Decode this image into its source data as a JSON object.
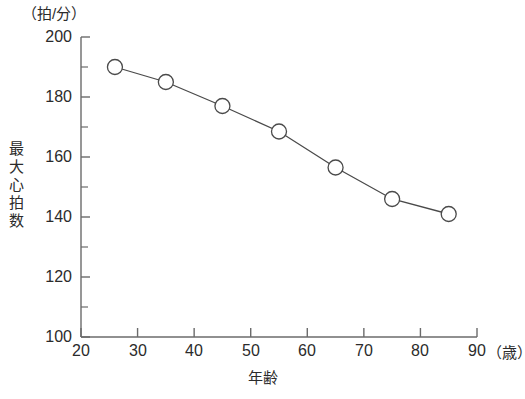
{
  "chart_data": {
    "type": "line",
    "title": "",
    "subtitle": "",
    "xlabel": "年齢",
    "ylabel": "最大心拍数",
    "x_unit": "（歳）",
    "y_unit": "（拍/分）",
    "xlim": [
      20,
      90
    ],
    "ylim": [
      100,
      200
    ],
    "grid": false,
    "legend": "none",
    "x_major_step": 10,
    "y_major_step": 20,
    "y_minor_step": 10,
    "marker": "open-circle",
    "x": [
      26,
      35,
      45,
      55,
      65,
      75,
      85
    ],
    "values": [
      190,
      185,
      177,
      168.5,
      156.5,
      146,
      141
    ],
    "points": [
      {
        "x": 26,
        "y": 190
      },
      {
        "x": 35,
        "y": 185
      },
      {
        "x": 45,
        "y": 177
      },
      {
        "x": 55,
        "y": 168.5
      },
      {
        "x": 65,
        "y": 156.5
      },
      {
        "x": 75,
        "y": 146
      },
      {
        "x": 85,
        "y": 141
      }
    ],
    "xticks": [
      20,
      30,
      40,
      50,
      60,
      70,
      80,
      90
    ],
    "xticklabels": [
      "20",
      "30",
      "40",
      "50",
      "60",
      "70",
      "80",
      "90"
    ],
    "yticks": [
      100,
      120,
      140,
      160,
      180,
      200
    ],
    "yticklabels": [
      "100",
      "120",
      "140",
      "160",
      "180",
      "200"
    ],
    "y_minor_ticks": [
      110,
      130,
      150,
      170,
      190
    ],
    "colors": {
      "axis": "#6b6b6b",
      "line": "#4a4a4a",
      "marker_stroke": "#4a4a4a",
      "marker_fill": "#ffffff",
      "text": "#2b2b2b",
      "background": "#ffffff"
    }
  },
  "axis_titles": {
    "y_unit_label": "（拍/分）",
    "y_axis_label_chars": [
      "最",
      "大",
      "心",
      "拍",
      "数"
    ],
    "x_axis_label": "年齢",
    "x_unit_label": "（歳）"
  },
  "tick_text": {
    "y": [
      "200",
      "180",
      "160",
      "140",
      "120",
      "100"
    ],
    "x": [
      "20",
      "30",
      "40",
      "50",
      "60",
      "70",
      "80",
      "90"
    ]
  }
}
